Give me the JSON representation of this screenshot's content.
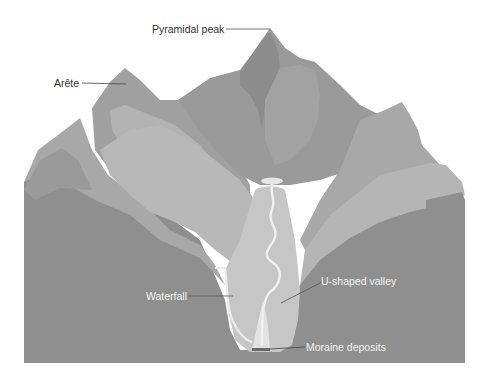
{
  "diagram": {
    "labels": {
      "pyramidal_peak": "Pyramidal peak",
      "arete": "Arête",
      "waterfall": "Waterfall",
      "u_shaped_valley": "U-shaped valley",
      "moraine_deposits": "Moraine deposits"
    },
    "colors": {
      "background": "#ffffff",
      "base_dark": "#8f8f8f",
      "mountain_mid": "#a3a3a3",
      "mountain_light": "#b5b5b5",
      "peak_dark": "#989898",
      "valley_fill": "#c4c4c4",
      "glacier_light": "#d9d9d9",
      "river": "#eeeeee",
      "leader_dark": "#444444",
      "leader_light": "#555555"
    }
  }
}
